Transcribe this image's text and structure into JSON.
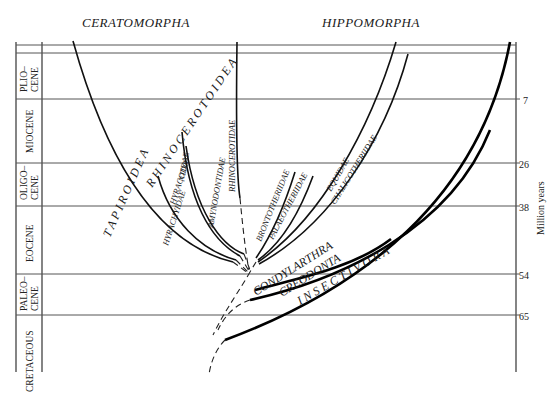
{
  "headers": {
    "left": "CERATOMORPHA",
    "right": "HIPPOMORPHA"
  },
  "periods": [
    {
      "name": "PLIO–",
      "name2": "CENE"
    },
    {
      "name": "MIOCENE"
    },
    {
      "name": "OLIGO–",
      "name2": "CENE"
    },
    {
      "name": "EOCENE"
    },
    {
      "name": "PALEO–",
      "name2": "CENE"
    },
    {
      "name": "CRETACEOUS"
    }
  ],
  "axis": {
    "label": "Million years",
    "ticks": [
      "7",
      "26",
      "38",
      "54",
      "65"
    ]
  },
  "taxa": {
    "superfamilies": [
      "TAPIROIDEA",
      "RHINOCEROTOIDEA"
    ],
    "families_ceratomorpha": [
      "HYRACHYIDAE",
      "HYRACODONTIDAE",
      "AMYNODONTIDAE",
      "RHINOCEROTIDAE"
    ],
    "families_hippomorpha": [
      "BRONTOTHERIIDAE",
      "PALAEOTHERIIDAE",
      "EQUIDAE",
      "CHALICOTHERIIDAE"
    ],
    "orders": [
      "CONDYLARTHRA",
      "CREODONTA",
      "INSECTIVORA"
    ]
  },
  "labels": {
    "tapiroidea": "T A P I R O I D E A",
    "rhinocerotoidea": "R H I N O C E R O T O I D E A",
    "hyrachyidae": "HYRACHYIDAE",
    "hyracodo": "HYRACODO–",
    "ntidae": "NTIDAE",
    "amynodontidae": "AMYNODONTIDAE",
    "rhinocerotidae": "RHINOCEROTIDAE",
    "brontotheriidae": "BRONTOTHERIIDAE",
    "palaeotheriidae": "PALAEOTHERIIDAE",
    "equidae": "EQUIDAE",
    "chalicotheriidae": "CHALICOTHERIIDAE",
    "condylarthra": "CONDYLARTHRA",
    "creodonta": "CREODONTA",
    "insectivora": "I N S E C T I V O R A"
  }
}
